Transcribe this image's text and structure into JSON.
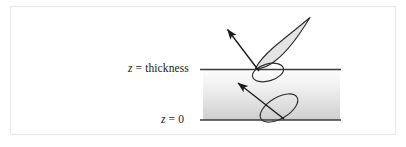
{
  "figure": {
    "type": "schematic-diagram",
    "border_color": "#e9e9e9",
    "background_color": "#ffffff"
  },
  "labels": {
    "thickness": {
      "variable": "z",
      "equals": "=",
      "value": "thickness",
      "full_text": "z = thickness"
    },
    "zero": {
      "variable": "z",
      "equals": "=",
      "value": "0",
      "full_text": "z = 0"
    }
  },
  "slab": {
    "name": "medium-slab",
    "x": 203,
    "y": 69,
    "width": 137,
    "height": 51,
    "gradient_top_color": "#fcfcfc",
    "gradient_bottom_color": "#cfcfcf",
    "top_boundary_label": "z = thickness",
    "bottom_boundary_label": "z = 0"
  },
  "boundaries": [
    {
      "name": "top-interface-line",
      "label": "z = thickness",
      "y": 69,
      "x1": 200,
      "x2": 341,
      "color": "#3a3a3a"
    },
    {
      "name": "bottom-interface-line",
      "label": "z = 0",
      "y": 120,
      "x1": 200,
      "x2": 341,
      "color": "#3a3a3a"
    }
  ],
  "lobes": [
    {
      "name": "upper-scattering-lobe",
      "description": "teardrop lobe above top interface pointing up-right",
      "fill_color": "#e4e4e4",
      "stroke_color": "#2e2e2e",
      "apex": {
        "x": 310,
        "y": 18
      },
      "base": {
        "x": 256,
        "y": 70
      }
    },
    {
      "name": "upper-interface-ellipse",
      "description": "small ellipse straddling the top interface",
      "fill_color": "none",
      "stroke_color": "#2e2e2e",
      "center": {
        "x": 268,
        "y": 72
      },
      "rx": 16,
      "ry": 9,
      "rotation_deg": -18
    },
    {
      "name": "lower-scattering-lobe",
      "description": "tilted ellipse inside the slab above the z = 0 line",
      "fill_color": "none",
      "stroke_color": "#2e2e2e",
      "center": {
        "x": 279,
        "y": 108
      },
      "rx": 21,
      "ry": 11,
      "rotation_deg": -32
    }
  ],
  "arrows": [
    {
      "name": "upper-scattered-ray-arrow",
      "description": "arrow from top interface going up-left",
      "from": {
        "x": 259,
        "y": 71
      },
      "to": {
        "x": 225,
        "y": 27
      },
      "color": "#1a1a1a"
    },
    {
      "name": "lower-scattered-ray-arrow",
      "description": "arrow from z = 0 line going up-left inside slab",
      "from": {
        "x": 284,
        "y": 119
      },
      "to": {
        "x": 236,
        "y": 81
      },
      "color": "#1a1a1a"
    }
  ],
  "colors": {
    "ink": "#1a1a1a",
    "line": "#3a3a3a",
    "lobe_fill": "#e4e4e4",
    "frame": "#e9e9e9"
  }
}
